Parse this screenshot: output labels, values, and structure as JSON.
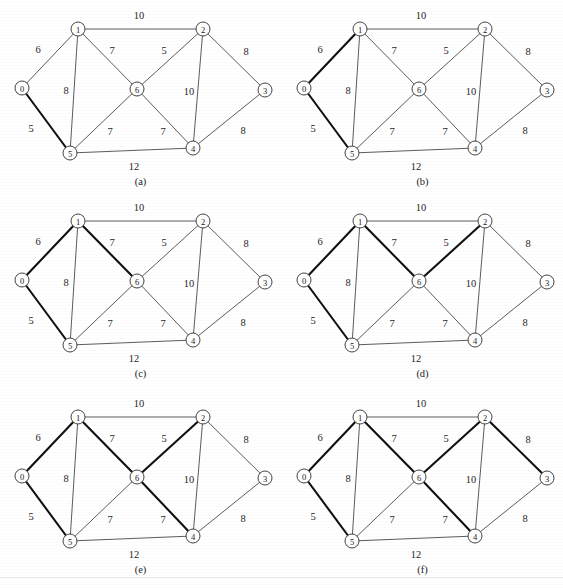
{
  "figure": {
    "width": 563,
    "height": 588,
    "background": "#ffffff",
    "edge_color": "#4a4a4a",
    "highlight_color": "#111111",
    "node_fill": "#ffffff",
    "node_stroke": "#3a3a3a",
    "panel_columns": 2,
    "panel_rows": 3,
    "panel_width": 281,
    "panel_height": 196,
    "column_offsets": [
      0,
      282
    ],
    "row_offsets": [
      0,
      192,
      388
    ]
  },
  "chart_data": {
    "type": "diagram",
    "subtype": "weighted-undirected-graph",
    "node_count": 7,
    "node_ids": [
      "0",
      "1",
      "2",
      "3",
      "4",
      "5",
      "6"
    ],
    "nodes": [
      {
        "id": "0",
        "label": "0",
        "x": 22,
        "y": 88
      },
      {
        "id": "1",
        "label": "1",
        "x": 78,
        "y": 29
      },
      {
        "id": "2",
        "label": "2",
        "x": 203,
        "y": 29
      },
      {
        "id": "3",
        "label": "3",
        "x": 265,
        "y": 90
      },
      {
        "id": "4",
        "label": "4",
        "x": 193,
        "y": 148
      },
      {
        "id": "5",
        "label": "5",
        "x": 70,
        "y": 153
      },
      {
        "id": "6",
        "label": "6",
        "x": 137,
        "y": 89
      }
    ],
    "node_radius": 7,
    "edges": [
      {
        "id": "0-1",
        "from": "0",
        "to": "1",
        "weight": 6,
        "label_x": 38,
        "label_y": 49
      },
      {
        "id": "0-5",
        "from": "0",
        "to": "5",
        "weight": 5,
        "label_x": 31,
        "label_y": 128
      },
      {
        "id": "1-2",
        "from": "1",
        "to": "2",
        "weight": 10,
        "label_x": 139,
        "label_y": 15
      },
      {
        "id": "1-5",
        "from": "1",
        "to": "5",
        "weight": 8,
        "label_x": 66,
        "label_y": 90
      },
      {
        "id": "1-6",
        "from": "1",
        "to": "6",
        "weight": 7,
        "label_x": 112,
        "label_y": 50
      },
      {
        "id": "2-6",
        "from": "2",
        "to": "6",
        "weight": 5,
        "label_x": 164,
        "label_y": 50
      },
      {
        "id": "2-3",
        "from": "2",
        "to": "3",
        "weight": 8,
        "label_x": 246,
        "label_y": 51
      },
      {
        "id": "2-4",
        "from": "2",
        "to": "4",
        "weight": 10,
        "label_x": 189,
        "label_y": 91
      },
      {
        "id": "3-4",
        "from": "3",
        "to": "4",
        "weight": 8,
        "label_x": 243,
        "label_y": 130
      },
      {
        "id": "4-6",
        "from": "4",
        "to": "6",
        "weight": 7,
        "label_x": 163,
        "label_y": 131
      },
      {
        "id": "5-6",
        "from": "5",
        "to": "6",
        "weight": 7,
        "label_x": 110,
        "label_y": 131
      },
      {
        "id": "4-5",
        "from": "4",
        "to": "5",
        "weight": 12,
        "label_x": 134,
        "label_y": 166
      }
    ],
    "edge_weights": {
      "0-1": 6,
      "0-5": 5,
      "1-2": 10,
      "1-5": 8,
      "1-6": 7,
      "2-6": 5,
      "2-3": 8,
      "2-4": 10,
      "3-4": 8,
      "4-6": 7,
      "5-6": 7,
      "4-5": 12
    },
    "panels": [
      {
        "key": "a",
        "caption": "(a)",
        "highlighted_edges": [
          "0-5"
        ]
      },
      {
        "key": "b",
        "caption": "(b)",
        "highlighted_edges": [
          "0-5",
          "0-1"
        ]
      },
      {
        "key": "c",
        "caption": "(c)",
        "highlighted_edges": [
          "0-5",
          "0-1",
          "1-6"
        ]
      },
      {
        "key": "d",
        "caption": "(d)",
        "highlighted_edges": [
          "0-5",
          "0-1",
          "1-6",
          "2-6"
        ]
      },
      {
        "key": "e",
        "caption": "(e)",
        "highlighted_edges": [
          "0-5",
          "0-1",
          "1-6",
          "2-6",
          "4-6"
        ]
      },
      {
        "key": "f",
        "caption": "(f)",
        "highlighted_edges": [
          "0-5",
          "0-1",
          "1-6",
          "2-6",
          "4-6",
          "2-3"
        ]
      }
    ],
    "captions": [
      "(a)",
      "(b)",
      "(c)",
      "(d)",
      "(e)",
      "(f)"
    ]
  },
  "artifacts": {
    "scan_line_y": 577
  }
}
